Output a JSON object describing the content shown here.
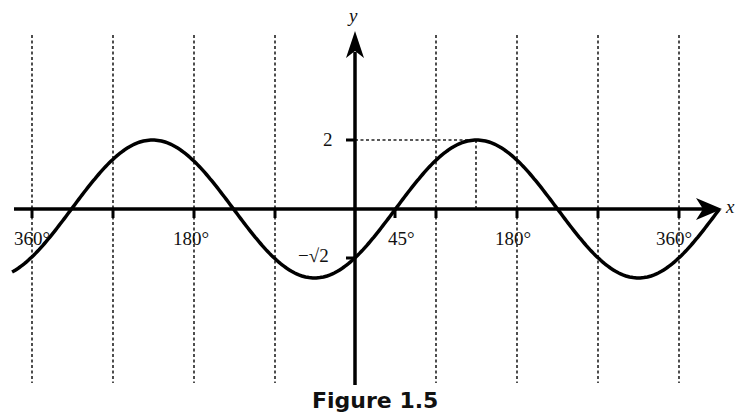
{
  "chart_data": {
    "type": "line",
    "title": "",
    "caption": "Figure 1.5",
    "xlabel": "x",
    "ylabel": "y",
    "function": "y = 2 sin(x - 45°)",
    "x_range_deg": [
      -405,
      405
    ],
    "x_tick_labels": [
      {
        "value": -360,
        "label": "360°"
      },
      {
        "value": -180,
        "label": "180°"
      },
      {
        "value": 45,
        "label": "45°"
      },
      {
        "value": 180,
        "label": "180°"
      },
      {
        "value": 360,
        "label": "360°"
      }
    ],
    "y_tick_labels": [
      {
        "value": 2,
        "label": "2"
      },
      {
        "value": -1.414,
        "label": "−√2"
      }
    ],
    "gridlines_x_deg": [
      -360,
      -270,
      -180,
      -90,
      90,
      180,
      270,
      360
    ],
    "annotations": [
      {
        "type": "dashed-guide",
        "from": [
          0,
          2
        ],
        "to": [
          135,
          2
        ]
      },
      {
        "type": "dashed-guide",
        "from": [
          135,
          0
        ],
        "to": [
          135,
          2
        ]
      }
    ],
    "key_points": [
      {
        "x": 0,
        "y": -1.414
      },
      {
        "x": 45,
        "y": 0
      },
      {
        "x": 135,
        "y": 2
      },
      {
        "x": 225,
        "y": 0
      },
      {
        "x": 315,
        "y": -2
      },
      {
        "x": -45,
        "y": -2
      },
      {
        "x": -135,
        "y": 0
      },
      {
        "x": -225,
        "y": 2
      },
      {
        "x": -315,
        "y": 0
      }
    ],
    "grid": false,
    "legend": null
  },
  "labels": {
    "x_axis": "x",
    "y_axis": "y",
    "y_two": "2",
    "y_neg_root2": "−√2",
    "x_neg360": "360°",
    "x_neg180": "180°",
    "x_45": "45°",
    "x_180": "180°",
    "x_360": "360°",
    "caption": "Figure 1.5"
  }
}
